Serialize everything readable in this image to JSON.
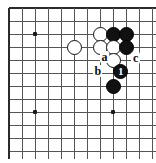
{
  "figure": {
    "type": "go-board-diagram",
    "board_width_px": 156,
    "board_height_px": 163,
    "grid": {
      "cell_size_px": 13,
      "origin_x_px": 9,
      "origin_y_px": 8,
      "columns": 11,
      "rows": 11,
      "edges": [
        "top",
        "left"
      ],
      "line_color": "#555555",
      "edge_color": "#2b2b2b",
      "background_color": "#ffffff"
    },
    "star_points": [
      {
        "name": "star-point-upper-left",
        "col": 2,
        "row": 2
      },
      {
        "name": "star-point-lower-left",
        "col": 2,
        "row": 8
      },
      {
        "name": "star-point-lower-center",
        "col": 8,
        "row": 8
      }
    ],
    "stones": [
      {
        "name": "white-stone-1",
        "color": "white",
        "col": 7,
        "row": 2,
        "label": ""
      },
      {
        "name": "black-stone-1",
        "color": "black",
        "col": 8,
        "row": 2,
        "label": ""
      },
      {
        "name": "black-stone-2",
        "color": "black",
        "col": 9,
        "row": 2,
        "label": ""
      },
      {
        "name": "white-stone-2",
        "color": "white",
        "col": 5,
        "row": 3,
        "label": ""
      },
      {
        "name": "white-stone-3",
        "color": "white",
        "col": 7,
        "row": 3,
        "label": ""
      },
      {
        "name": "white-stone-4",
        "color": "white",
        "col": 8,
        "row": 3,
        "label": ""
      },
      {
        "name": "black-stone-3",
        "color": "black",
        "col": 9,
        "row": 3,
        "label": ""
      },
      {
        "name": "white-stone-5",
        "color": "white",
        "col": 8,
        "row": 4,
        "label": ""
      },
      {
        "name": "black-stone-move-1",
        "color": "black",
        "col": 8.6,
        "row": 4.85,
        "label": "1"
      },
      {
        "name": "black-stone-4",
        "color": "black",
        "col": 8,
        "row": 6,
        "label": ""
      }
    ],
    "point_labels": [
      {
        "name": "point-label-a",
        "text": "a",
        "col": 7.3,
        "row": 3.75
      },
      {
        "name": "point-label-c",
        "text": "c",
        "col": 9.7,
        "row": 3.85
      },
      {
        "name": "point-label-b",
        "text": "b",
        "col": 6.8,
        "row": 4.85
      }
    ],
    "legend": {
      "numbered_stone_color": "#ffffff",
      "black_color": "#111111",
      "white_color": "#ffffff"
    }
  }
}
